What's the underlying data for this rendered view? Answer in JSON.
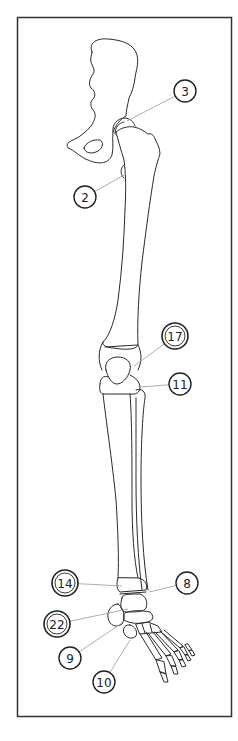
{
  "figure": {
    "type": "anatomical-line-drawing",
    "frame": {
      "x": 17,
      "y": 17,
      "width": 215,
      "height": 700,
      "stroke": "#333333"
    },
    "line_color": "#2a2a2a",
    "leader_color": "#9a9a9a"
  },
  "callouts": [
    {
      "id": "c3",
      "label": "3",
      "cx": 185,
      "cy": 91,
      "double": false,
      "tx": 127,
      "ty": 121
    },
    {
      "id": "c2",
      "label": "2",
      "cx": 85,
      "cy": 197,
      "double": false,
      "tx": 126,
      "ty": 174
    },
    {
      "id": "c17",
      "label": "17",
      "cx": 175,
      "cy": 336,
      "double": true,
      "tx": 134,
      "ty": 366
    },
    {
      "id": "c11",
      "label": "11",
      "cx": 180,
      "cy": 384,
      "double": false,
      "tx": 140,
      "ty": 387
    },
    {
      "id": "c14",
      "label": "14",
      "cx": 65,
      "cy": 583,
      "double": true,
      "tx": 122,
      "ty": 586
    },
    {
      "id": "c8",
      "label": "8",
      "cx": 187,
      "cy": 583,
      "double": false,
      "tx": 149,
      "ty": 592
    },
    {
      "id": "c22",
      "label": "22",
      "cx": 57,
      "cy": 624,
      "double": true,
      "tx": 128,
      "ty": 609
    },
    {
      "id": "c9",
      "label": "9",
      "cx": 70,
      "cy": 658,
      "double": false,
      "tx": 122,
      "ty": 623
    },
    {
      "id": "c10",
      "label": "10",
      "cx": 104,
      "cy": 682,
      "double": false,
      "tx": 130,
      "ty": 640
    }
  ]
}
